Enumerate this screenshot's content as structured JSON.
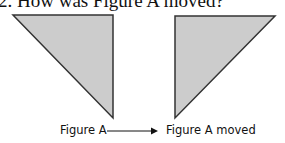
{
  "question": {
    "text": "2. How was Figure A moved?"
  },
  "figures": {
    "original": {
      "label": "Figure A",
      "points": "13,15 113,15 113,118",
      "fill": "#cccccc",
      "stroke": "#333333"
    },
    "moved": {
      "label": "Figure A moved",
      "points": "175,16 275,16 175,118",
      "fill": "#cccccc",
      "stroke": "#333333"
    }
  },
  "arrow": {
    "icon": "right-arrow-icon",
    "color": "#111111"
  }
}
